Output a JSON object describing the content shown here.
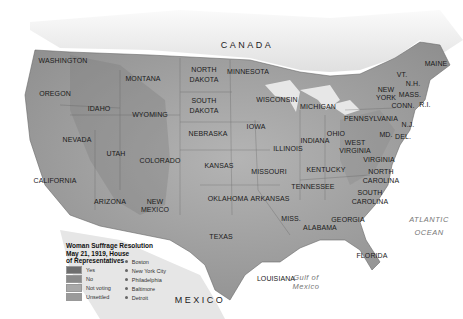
{
  "map": {
    "title": "Woman Suffrage Resolution May 21, 1919, House of Representatives",
    "title_lines": [
      "Woman Suffrage Resolution",
      "May 21, 1919, House",
      "of Representatives"
    ],
    "countries": [
      {
        "name": "CANADA",
        "x": 247,
        "y": 45
      },
      {
        "name": "MEXICO",
        "x": 200,
        "y": 300
      }
    ],
    "water_bodies": [
      {
        "name": "ATLANTIC",
        "x": 429,
        "y": 220
      },
      {
        "name": "OCEAN",
        "x": 429,
        "y": 233
      },
      {
        "name": "Gulf of",
        "x": 306,
        "y": 278
      },
      {
        "name": "Mexico",
        "x": 306,
        "y": 287
      }
    ],
    "states": [
      {
        "name": "WASHINGTON",
        "x": 63,
        "y": 61
      },
      {
        "name": "OREGON",
        "x": 55,
        "y": 94
      },
      {
        "name": "IDAHO",
        "x": 99,
        "y": 109
      },
      {
        "name": "MONTANA",
        "x": 143,
        "y": 79
      },
      {
        "name": "WYOMING",
        "x": 150,
        "y": 115
      },
      {
        "name": "NEVADA",
        "x": 77,
        "y": 140
      },
      {
        "name": "UTAH",
        "x": 116,
        "y": 154
      },
      {
        "name": "COLORADO",
        "x": 160,
        "y": 161
      },
      {
        "name": "CALIFORNIA",
        "x": 55,
        "y": 181
      },
      {
        "name": "ARIZONA",
        "x": 110,
        "y": 202
      },
      {
        "name": "NEW",
        "x": 155,
        "y": 202
      },
      {
        "name": "MEXICO",
        "x": 155,
        "y": 210
      },
      {
        "name": "NORTH",
        "x": 204,
        "y": 70
      },
      {
        "name": "DAKOTA",
        "x": 204,
        "y": 80
      },
      {
        "name": "SOUTH",
        "x": 204,
        "y": 101
      },
      {
        "name": "DAKOTA",
        "x": 204,
        "y": 111
      },
      {
        "name": "NEBRASKA",
        "x": 208,
        "y": 134
      },
      {
        "name": "KANSAS",
        "x": 219,
        "y": 166
      },
      {
        "name": "OKLAHOMA",
        "x": 228,
        "y": 199
      },
      {
        "name": "TEXAS",
        "x": 221,
        "y": 237
      },
      {
        "name": "MINNESOTA",
        "x": 248,
        "y": 72
      },
      {
        "name": "IOWA",
        "x": 256,
        "y": 127
      },
      {
        "name": "MISSOURI",
        "x": 269,
        "y": 172
      },
      {
        "name": "ARKANSAS",
        "x": 270,
        "y": 199
      },
      {
        "name": "LOUISIANA",
        "x": 276,
        "y": 279
      },
      {
        "name": "WISCONSIN",
        "x": 277,
        "y": 100
      },
      {
        "name": "ILLINOIS",
        "x": 288,
        "y": 149
      },
      {
        "name": "MISS.",
        "x": 291,
        "y": 219
      },
      {
        "name": "MICHIGAN",
        "x": 318,
        "y": 107
      },
      {
        "name": "INDIANA",
        "x": 315,
        "y": 141
      },
      {
        "name": "OHIO",
        "x": 336,
        "y": 134
      },
      {
        "name": "KENTUCKY",
        "x": 326,
        "y": 170
      },
      {
        "name": "TENNESSEE",
        "x": 313,
        "y": 187
      },
      {
        "name": "ALABAMA",
        "x": 320,
        "y": 228
      },
      {
        "name": "GEORGIA",
        "x": 348,
        "y": 220
      },
      {
        "name": "FLORIDA",
        "x": 372,
        "y": 256
      },
      {
        "name": "WEST",
        "x": 355,
        "y": 143
      },
      {
        "name": "VIRGINIA",
        "x": 355,
        "y": 151
      },
      {
        "name": "VIRGINIA",
        "x": 379,
        "y": 160
      },
      {
        "name": "NORTH",
        "x": 381,
        "y": 172
      },
      {
        "name": "CAROLINA",
        "x": 381,
        "y": 181
      },
      {
        "name": "SOUTH",
        "x": 370,
        "y": 193
      },
      {
        "name": "CAROLINA",
        "x": 370,
        "y": 202
      },
      {
        "name": "PENNSYLVANIA",
        "x": 371,
        "y": 119
      },
      {
        "name": "NEW",
        "x": 386,
        "y": 90
      },
      {
        "name": "YORK",
        "x": 386,
        "y": 98
      },
      {
        "name": "MD.",
        "x": 386,
        "y": 135
      },
      {
        "name": "DEL.",
        "x": 403,
        "y": 137
      },
      {
        "name": "N.J.",
        "x": 408,
        "y": 125
      },
      {
        "name": "CONN.",
        "x": 403,
        "y": 106
      },
      {
        "name": "R.I.",
        "x": 425,
        "y": 105
      },
      {
        "name": "MASS.",
        "x": 410,
        "y": 95
      },
      {
        "name": "N.H.",
        "x": 413,
        "y": 84
      },
      {
        "name": "VT.",
        "x": 402,
        "y": 75
      },
      {
        "name": "MAINE",
        "x": 436,
        "y": 64
      }
    ]
  },
  "legend": {
    "categories": [
      {
        "label": "Yes",
        "color": "#6e6e6e"
      },
      {
        "label": "No",
        "color": "#8a8a8a"
      },
      {
        "label": "Not voting",
        "color": "#a8a8a8"
      },
      {
        "label": "Unsettled",
        "color": "#9a9a9a"
      }
    ],
    "cities": [
      "Boston",
      "New York City",
      "Philadelphia",
      "Baltimore",
      "Detroit"
    ]
  }
}
